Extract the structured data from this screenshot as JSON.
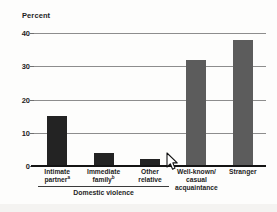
{
  "chart_data": {
    "type": "bar",
    "title": "",
    "subtitle": "",
    "xlabel": "",
    "ylabel": "Percent",
    "ylim": [
      0,
      40
    ],
    "yticks": [
      0,
      10,
      20,
      30,
      40
    ],
    "grid": true,
    "legend": null,
    "categories": [
      "Intimate partner",
      "Immediate family",
      "Other relative",
      "Well-known/ casual acquaintance",
      "Stranger"
    ],
    "values": [
      15,
      4,
      2,
      32,
      38
    ],
    "bar_colors": [
      "#232323",
      "#232323",
      "#232323",
      "#5c5c5c",
      "#5c5c5c"
    ],
    "group_annotations": [
      {
        "label": "Domestic violence",
        "categories": [
          0,
          1,
          2
        ]
      }
    ],
    "footnote_markers": [
      "a",
      "b",
      "",
      "",
      ""
    ]
  },
  "axis": {
    "y_title": "Percent",
    "tick_labels": [
      "0",
      "10",
      "20",
      "30",
      "40"
    ]
  },
  "categories": [
    {
      "line1": "Intimate",
      "line2": "partner",
      "sup": "a",
      "line3": ""
    },
    {
      "line1": "Immediate",
      "line2": "family",
      "sup": "b",
      "line3": ""
    },
    {
      "line1": "Other",
      "line2": "relative",
      "sup": "",
      "line3": ""
    },
    {
      "line1": "Well-known/",
      "line2": "casual",
      "sup": "",
      "line3": "acquaintance"
    },
    {
      "line1": "Stranger",
      "line2": "",
      "sup": "",
      "line3": ""
    }
  ],
  "group": {
    "label": "Domestic violence"
  },
  "cursor": {
    "icon": "mouse-pointer-icon"
  }
}
